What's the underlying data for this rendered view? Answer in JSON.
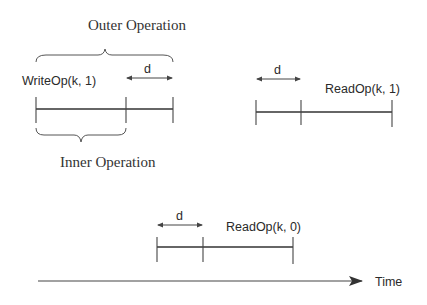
{
  "labels": {
    "outer_operation": "Outer Operation",
    "inner_operation": "Inner Operation",
    "write_op": "WriteOp(k, 1)",
    "read_op_1": "ReadOp(k, 1)",
    "read_op_0": "ReadOp(k, 0)",
    "delay_write": "d",
    "delay_read_1": "d",
    "delay_read_0": "d",
    "time_axis": "Time"
  },
  "colors": {
    "stroke": "#333333",
    "text": "#2a2a2a",
    "background": "#ffffff"
  }
}
